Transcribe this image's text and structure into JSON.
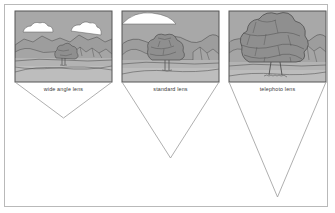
{
  "figure": {
    "background_color": "#ffffff",
    "frame": {
      "name": "outer-frame",
      "x": 4.5,
      "y": 4.5,
      "width": 323,
      "height": 202,
      "stroke_color": "#b9b9b9",
      "fill": "#ffffff"
    },
    "ink_color": "#4a4a4a",
    "panel_border_color": "#555555"
  },
  "palette": {
    "sky": "#a8a8a8",
    "cloud": "#ffffff",
    "mountain_far": "#9d9d9d",
    "mountain_mid": "#a5a5a5",
    "ground": "#bdbdbd",
    "field": "#b3b3b3",
    "foliage": "#8f8f8f",
    "foliage_light": "#9c9c9c",
    "trunk": "#a0a0a0",
    "outline": "#4f4f4f",
    "cone_stroke": "#9a9a9a"
  },
  "panels": [
    {
      "id": "wide-angle",
      "label": "wide angle lens",
      "frame": {
        "x": 15,
        "y": 11,
        "width": 97,
        "height": 71
      },
      "label_position": {
        "x": 63.5,
        "y": 90.5
      },
      "cone": {
        "apex": {
          "x": 63.5,
          "y": 118
        },
        "left": {
          "x": 15,
          "y": 82
        },
        "right": {
          "x": 112,
          "y": 82
        },
        "angle_description": "widest field of view, shortest cone"
      },
      "scene": {
        "tree_center_x": 63,
        "tree_scale": 0.34,
        "clouds": 2,
        "description": "small distant tree with broad mountain panorama"
      }
    },
    {
      "id": "standard",
      "label": "standard lens",
      "frame": {
        "x": 122,
        "y": 11,
        "width": 97,
        "height": 71
      },
      "label_position": {
        "x": 170.5,
        "y": 90.5
      },
      "cone": {
        "apex": {
          "x": 170.5,
          "y": 158
        },
        "left": {
          "x": 122,
          "y": 82
        },
        "right": {
          "x": 219,
          "y": 82
        },
        "angle_description": "normal field of view, medium cone"
      },
      "scene": {
        "tree_center_x": 168,
        "tree_scale": 0.62,
        "clouds": 1,
        "description": "medium tree, mountains partly cropped"
      }
    },
    {
      "id": "telephoto",
      "label": "telephoto lens",
      "frame": {
        "x": 229,
        "y": 11,
        "width": 97,
        "height": 71
      },
      "label_position": {
        "x": 277.5,
        "y": 90.5
      },
      "cone": {
        "apex": {
          "x": 277.5,
          "y": 197
        },
        "left": {
          "x": 229,
          "y": 82
        },
        "right": {
          "x": 326,
          "y": 82
        },
        "angle_description": "narrowest field of view, longest cone"
      },
      "scene": {
        "tree_center_x": 276,
        "tree_scale": 1.0,
        "clouds": 0,
        "description": "tree fills frame, background compressed"
      }
    }
  ]
}
